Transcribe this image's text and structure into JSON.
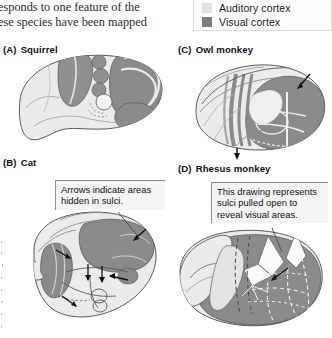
{
  "figure": {
    "caption_lines": [
      "esponds to one feature of the",
      "ese species have been mapped"
    ]
  },
  "legend": {
    "items": [
      {
        "label": "Auditory cortex",
        "color": "#e2e2e2",
        "name": "auditory-cortex"
      },
      {
        "label": "Visual cortex",
        "color": "#7d7d7d",
        "name": "visual-cortex"
      }
    ]
  },
  "panels": [
    {
      "tag": "(A)",
      "title": "Squirrel",
      "name": "panel-a-squirrel"
    },
    {
      "tag": "(B)",
      "title": "Cat",
      "name": "panel-b-cat"
    },
    {
      "tag": "(C)",
      "title": "Owl monkey",
      "name": "panel-c-owl-monkey"
    },
    {
      "tag": "(D)",
      "title": "Rhesus monkey",
      "name": "panel-d-rhesus-monkey"
    }
  ],
  "annotations": {
    "cat_callout": {
      "lines": [
        "Arrows indicate areas",
        "hidden in sulci."
      ]
    },
    "rhesus_callout": {
      "lines": [
        "This drawing represents",
        "sulci pulled open to",
        "reveal visual areas."
      ]
    }
  },
  "colors": {
    "page_background": "#ffffff",
    "brain_light": "#ebebeb",
    "brain_mid": "#cfcfcf",
    "brain_dark": "#848484",
    "brain_darker": "#6e6e6e",
    "outline": "#5a5a5a",
    "callout_fill": "#f4f4f4",
    "callout_border": "#8d8d8d",
    "text": "#111111"
  }
}
